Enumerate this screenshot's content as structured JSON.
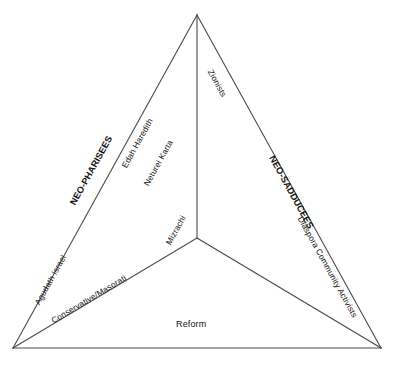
{
  "diagram": {
    "type": "triangle-spectrum",
    "title": "",
    "background_color": "#ffffff",
    "line_color": "#4a4a4a",
    "text_color": "#111111",
    "vertices": {
      "apex": [
        197,
        15
      ],
      "bottom_left": [
        13,
        348
      ],
      "bottom_right": [
        381,
        348
      ],
      "center": [
        197,
        238
      ]
    },
    "poles": [
      {
        "id": "neo-pharisees",
        "label": "NEO-PHARISEES",
        "bold": true,
        "edge": "left"
      },
      {
        "id": "neo-sadducees",
        "label": "NEO-SADDUCEES",
        "bold": true,
        "edge": "right"
      }
    ],
    "edge_labels": [
      {
        "id": "zionists",
        "label": "Zionists",
        "edge": "upper-right"
      },
      {
        "id": "edah-haredith",
        "label": "Edah Haredith",
        "edge": "upper-left-inner"
      },
      {
        "id": "neturei-karta",
        "label": "Neturei Karta",
        "edge": "upper-left-inner-2"
      },
      {
        "id": "agudath-israel",
        "label": "Agudath Israel",
        "edge": "lower-left"
      },
      {
        "id": "diaspora-community-activists",
        "label": "Diaspora Community Activists",
        "edge": "lower-right"
      },
      {
        "id": "conservative-masorati",
        "label": "Conservative/Masorati",
        "edge": "spoke-lower-left"
      },
      {
        "id": "mizrachi",
        "label": "Mizrachi",
        "edge": "spoke-upper"
      },
      {
        "id": "reform",
        "label": "Reform",
        "edge": "bottom-base"
      }
    ]
  }
}
